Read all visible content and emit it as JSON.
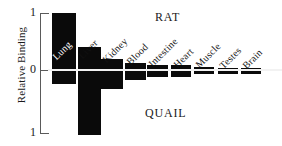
{
  "chart_data": {
    "type": "bar",
    "title": "",
    "xlabel": "",
    "ylabel": "Relative Binding",
    "ylim": [
      -1,
      1
    ],
    "grid": false,
    "legend_position": "in-plot-annotations",
    "zero_baseline": 0,
    "categories": [
      "Lung",
      "Liver",
      "Kidney",
      "Blood",
      "Intestine",
      "Heart",
      "Muscle",
      "Testes",
      "Brain"
    ],
    "series": [
      {
        "name": "RAT",
        "values": [
          1.0,
          0.4,
          0.2,
          0.13,
          0.08,
          0.08,
          0.05,
          0.04,
          0.04
        ]
      },
      {
        "name": "QUAIL",
        "values": [
          -0.2,
          -1.0,
          -0.28,
          -0.14,
          -0.1,
          -0.09,
          -0.05,
          -0.05,
          -0.05
        ]
      }
    ],
    "ytick_labels": [
      "1",
      "0",
      "1"
    ],
    "ytick_values": [
      1,
      0,
      -1
    ],
    "annotations": [
      "RAT",
      "QUAIL"
    ]
  },
  "axis": {
    "ylabel": "Relative Binding",
    "tick_top": "1",
    "tick_mid": "0",
    "tick_bottom": "1"
  },
  "annotations": {
    "rat": "RAT",
    "quail": "QUAIL"
  },
  "colors": {
    "bar": "#0a0a0a",
    "axis": "#5a5a5a",
    "text": "#1a1a1a",
    "baseline": "#f2f2f2",
    "background": "#ffffff"
  }
}
